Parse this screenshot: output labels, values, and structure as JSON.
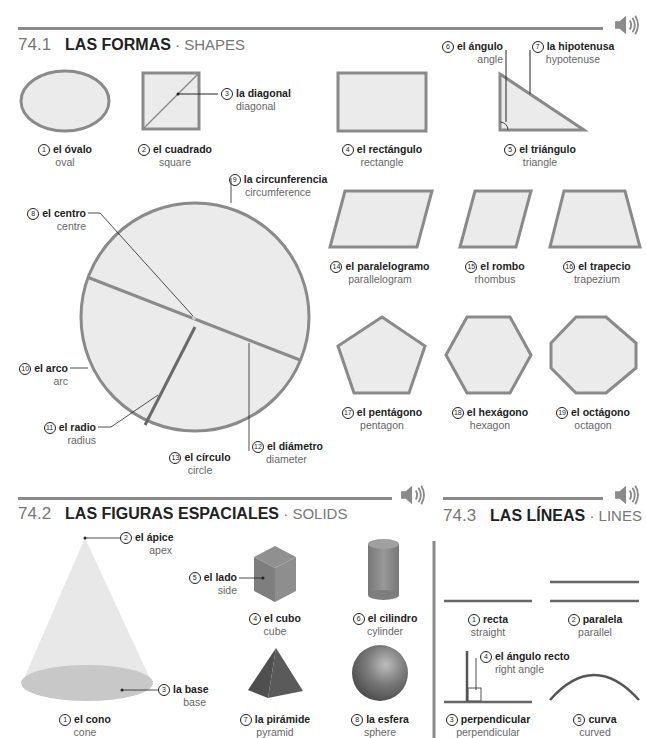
{
  "colors": {
    "shape_fill": "#ebebeb",
    "shape_stroke": "#8a8a8a",
    "rule": "#8a8a8a",
    "cone": "#e6e6e6",
    "solid_dark": "#6d6d6d"
  },
  "icons": {
    "speaker": "speaker-icon"
  },
  "sections": [
    {
      "number": "74.1",
      "title_es": "LAS FORMAS",
      "separator": " · ",
      "title_en": "SHAPES",
      "items": [
        {
          "n": "1",
          "es": "el óvalo",
          "en": "oval"
        },
        {
          "n": "2",
          "es": "el cuadrado",
          "en": "square"
        },
        {
          "n": "3",
          "es": "la diagonal",
          "en": "diagonal"
        },
        {
          "n": "4",
          "es": "el rectángulo",
          "en": "rectangle"
        },
        {
          "n": "5",
          "es": "el triángulo",
          "en": "triangle"
        },
        {
          "n": "6",
          "es": "el ángulo",
          "en": "angle"
        },
        {
          "n": "7",
          "es": "la hipotenusa",
          "en": "hypotenuse"
        },
        {
          "n": "8",
          "es": "el centro",
          "en": "centre"
        },
        {
          "n": "9",
          "es": "la circunferencia",
          "en": "circumference"
        },
        {
          "n": "10",
          "es": "el arco",
          "en": "arc"
        },
        {
          "n": "11",
          "es": "el radio",
          "en": "radius"
        },
        {
          "n": "12",
          "es": "el diámetro",
          "en": "diameter"
        },
        {
          "n": "13",
          "es": "el círculo",
          "en": "circle"
        },
        {
          "n": "14",
          "es": "el paralelogramo",
          "en": "parallelogram"
        },
        {
          "n": "15",
          "es": "el rombo",
          "en": "rhombus"
        },
        {
          "n": "16",
          "es": "el trapecio",
          "en": "trapezium"
        },
        {
          "n": "17",
          "es": "el pentágono",
          "en": "pentagon"
        },
        {
          "n": "18",
          "es": "el hexágono",
          "en": "hexagon"
        },
        {
          "n": "19",
          "es": "el octágono",
          "en": "octagon"
        }
      ]
    },
    {
      "number": "74.2",
      "title_es": "LAS FIGURAS ESPACIALES",
      "separator": " · ",
      "title_en": "SOLIDS",
      "items": [
        {
          "n": "1",
          "es": "el cono",
          "en": "cone"
        },
        {
          "n": "2",
          "es": "el ápice",
          "en": "apex"
        },
        {
          "n": "3",
          "es": "la base",
          "en": "base"
        },
        {
          "n": "4",
          "es": "el cubo",
          "en": "cube"
        },
        {
          "n": "5",
          "es": "el lado",
          "en": "side"
        },
        {
          "n": "6",
          "es": "el cilindro",
          "en": "cylinder"
        },
        {
          "n": "7",
          "es": "la pirámide",
          "en": "pyramid"
        },
        {
          "n": "8",
          "es": "la esfera",
          "en": "sphere"
        }
      ]
    },
    {
      "number": "74.3",
      "title_es": "LAS LÍNEAS",
      "separator": " · ",
      "title_en": "LINES",
      "items": [
        {
          "n": "1",
          "es": "recta",
          "en": "straight"
        },
        {
          "n": "2",
          "es": "paralela",
          "en": "parallel"
        },
        {
          "n": "3",
          "es": "perpendicular",
          "en": "perpendicular"
        },
        {
          "n": "4",
          "es": "el ángulo recto",
          "en": "right angle"
        },
        {
          "n": "5",
          "es": "curva",
          "en": "curved"
        }
      ]
    }
  ]
}
